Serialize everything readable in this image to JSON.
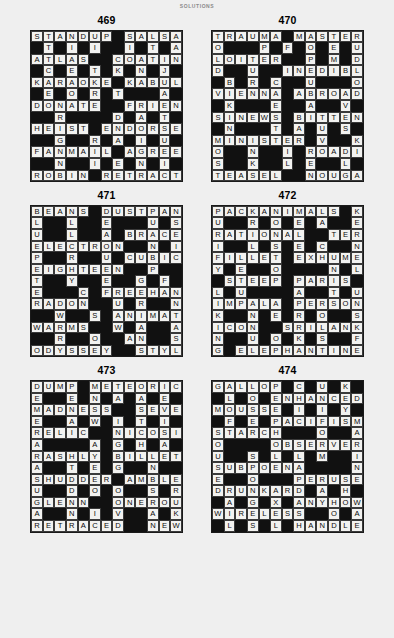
{
  "header": {
    "title": "SOLUTIONS"
  },
  "puzzles": [
    {
      "number": "469",
      "rows": [
        "STANDUP#SALSA",
        "#I##I##I#T##A",
        "ATLAS#COATING",
        "#E##T#K#N##J#",
        "KARAOKE#KABUL",
        "#O##R#T###A##",
        "DONATE#FRIEND",
        "#R####D#A#T#E",
        "HEIST#ENDORSE",
        "#G###R#A#I#U#",
        "FANMAIL#AGREE",
        "#N###I#E#N#I#",
        "ROBIN#RETRACT"
      ]
    },
    {
      "number": "470",
      "rows": [
        "TRAUMA#MASTER",
        "O###P#F#O#E##",
        "LOITER##P#M#U",
        "D###U#INEDIBL",
        "#B##R#C##U##O",
        "VIENNA#ABROAD",
        "#K###E###A##V",
        "SINEWS#BITTEN",
        "#N###T#A#U#S#",
        "MINISTER#V##K",
        "O###N#I#ROADIE",
        "S###K#L#E#L##",
        "TEASEL##NOUGAT"
      ]
    },
    {
      "number": "471",
      "rows": [
        "BEANS#DUSTPAN",
        "L##L##E###U#S",
        "U##L##A#BRACE",
        "ELECTRON##N#I",
        "P##R##U##CUBIC",
        "EIGHTEEN##P##O",
        "T##Y##E###G#F#L",
        "E###C#FREEHAND",
        "RADON##U#R##N#F",
        "#W##S#ANIMATOR",
        "WARMS#W#A##A#A",
        "#R##O##A#N##S#M",
        "ODYSSEY##STYLE"
      ]
    },
    {
      "number": "472",
      "rows": [
        "PACKANIMALS#K",
        "U##R#O#E#A##E",
        "RATIONAL##TERN",
        "I##L#S#E#C##N",
        "FILLET#EXHUME",
        "Y##E##O####N#L",
        "#STEEP#PARIS#",
        "L##U####A##T#U",
        "IMPALA#PERSON",
        "K##N##E#R#O##S",
        "ICON##SRILANKA",
        "N##U#O#K#S##F",
        "G#ELEPHANTINE"
      ]
    },
    {
      "number": "473",
      "rows": [
        "DUMP#METEORIC",
        "E##E#N#A#A#E#O",
        "MADNESS##SEVEN",
        "E##A#W#I#T#I#T",
        "RELIC##NICOSIA",
        "A####A#G#H#A#C",
        "RASHLY#BILLET",
        "A##T#E#G##N##L",
        "SHUDDER#AMBLE",
        "U##D#O#O##S#R#E",
        "GLENN##ONEROUS",
        "A##N#I#V##A#K#E",
        "RETRACED#NEWS"
      ]
    },
    {
      "number": "474",
      "rows": [
        "GALLOP#C#U#K#",
        "#L#O#ENHANCED",
        "MOUSSE#I##I#Y",
        "#F#E#PACIFISM",
        "STARCH###O##A",
        "O####OBSERVER",
        "U##S#L#L##M##I",
        "SUBPOENA####N",
        "E##O###PERUSE",
        "DRUNKARD#A#H#",
        "#A#G#X#ANYHOW",
        "WIRELESS##O#A",
        "#L#S#L#HANDLE"
      ]
    }
  ],
  "grids": {
    "p469": [
      [
        "S",
        "T",
        "A",
        "N",
        "D",
        "U",
        "P",
        "#",
        "S",
        "A",
        "L",
        "S",
        "A"
      ],
      [
        "#",
        "T",
        "#",
        "I",
        "#",
        "I",
        "#",
        "#",
        "I",
        "#",
        "T",
        "#",
        "A"
      ],
      [
        "A",
        "T",
        "L",
        "A",
        "S",
        "#",
        "#",
        "C",
        "O",
        "A",
        "T",
        "I",
        "N"
      ],
      [
        "#",
        "C",
        "#",
        "E",
        "#",
        "T",
        "#",
        "K",
        "#",
        "N",
        "#",
        "J",
        "#"
      ],
      [
        "K",
        "A",
        "R",
        "A",
        "O",
        "K",
        "E",
        "#",
        "K",
        "A",
        "B",
        "U",
        "L"
      ],
      [
        "#",
        "E",
        "#",
        "O",
        "#",
        "R",
        "#",
        "T",
        "#",
        "#",
        "#",
        "A",
        "#"
      ],
      [
        "D",
        "O",
        "N",
        "A",
        "T",
        "E",
        "#",
        "#",
        "F",
        "R",
        "I",
        "E",
        "N"
      ],
      [
        "#",
        "#",
        "R",
        "#",
        "#",
        "#",
        "#",
        "D",
        "#",
        "A",
        "#",
        "T",
        "#"
      ],
      [
        "H",
        "E",
        "I",
        "S",
        "T",
        "#",
        "E",
        "N",
        "D",
        "O",
        "R",
        "S",
        "E"
      ],
      [
        "#",
        "#",
        "G",
        "#",
        "#",
        "R",
        "#",
        "A",
        "#",
        "I",
        "#",
        "U",
        "#"
      ],
      [
        "F",
        "A",
        "N",
        "M",
        "A",
        "I",
        "L",
        "#",
        "A",
        "G",
        "R",
        "E",
        "E"
      ],
      [
        "#",
        "#",
        "N",
        "#",
        "#",
        "I",
        "#",
        "E",
        "#",
        "N",
        "#",
        "I",
        "#"
      ],
      [
        "R",
        "O",
        "B",
        "I",
        "N",
        "#",
        "R",
        "E",
        "T",
        "R",
        "A",
        "C",
        "T"
      ]
    ],
    "p470": [
      [
        "T",
        "R",
        "A",
        "U",
        "M",
        "A",
        "#",
        "M",
        "A",
        "S",
        "T",
        "E",
        "R"
      ],
      [
        "O",
        "#",
        "#",
        "#",
        "P",
        "#",
        "F",
        "#",
        "O",
        "#",
        "E",
        "#",
        "U"
      ],
      [
        "L",
        "O",
        "I",
        "T",
        "E",
        "R",
        "#",
        "#",
        "P",
        "#",
        "M",
        "#",
        "D"
      ],
      [
        "D",
        "#",
        "#",
        "U",
        "#",
        "#",
        "I",
        "N",
        "E",
        "D",
        "I",
        "B",
        "L"
      ],
      [
        "#",
        "B",
        "#",
        "R",
        "#",
        "C",
        "#",
        "#",
        "U",
        "#",
        "#",
        "#",
        "O"
      ],
      [
        "V",
        "I",
        "E",
        "N",
        "N",
        "A",
        "#",
        "A",
        "B",
        "R",
        "O",
        "A",
        "D"
      ],
      [
        "#",
        "K",
        "#",
        "#",
        "#",
        "E",
        "#",
        "#",
        "A",
        "#",
        "#",
        "V",
        "#"
      ],
      [
        "S",
        "I",
        "N",
        "E",
        "W",
        "S",
        "#",
        "B",
        "I",
        "T",
        "T",
        "E",
        "N"
      ],
      [
        "#",
        "N",
        "#",
        "#",
        "#",
        "T",
        "#",
        "A",
        "#",
        "U",
        "#",
        "S",
        "#"
      ],
      [
        "M",
        "I",
        "N",
        "I",
        "S",
        "T",
        "E",
        "R",
        "#",
        "V",
        "#",
        "#",
        "K"
      ],
      [
        "O",
        "#",
        "#",
        "N",
        "#",
        "#",
        "I",
        "#",
        "R",
        "O",
        "A",
        "D",
        "I"
      ],
      [
        "S",
        "#",
        "#",
        "K",
        "#",
        "#",
        "L",
        "#",
        "E",
        "#",
        "#",
        "L",
        "#"
      ],
      [
        "T",
        "E",
        "A",
        "S",
        "E",
        "L",
        "#",
        "#",
        "N",
        "O",
        "U",
        "G",
        "A"
      ]
    ],
    "p471": [
      [
        "B",
        "E",
        "A",
        "N",
        "S",
        "#",
        "D",
        "U",
        "S",
        "T",
        "P",
        "A",
        "N"
      ],
      [
        "L",
        "#",
        "#",
        "L",
        "#",
        "#",
        "E",
        "#",
        "#",
        "#",
        "U",
        "#",
        "S"
      ],
      [
        "U",
        "#",
        "#",
        "L",
        "#",
        "#",
        "A",
        "#",
        "B",
        "R",
        "A",
        "C",
        "E"
      ],
      [
        "E",
        "L",
        "E",
        "C",
        "T",
        "R",
        "O",
        "N",
        "#",
        "#",
        "N",
        "#",
        "I"
      ],
      [
        "P",
        "#",
        "#",
        "R",
        "#",
        "#",
        "U",
        "#",
        "C",
        "U",
        "B",
        "I",
        "C"
      ],
      [
        "E",
        "I",
        "G",
        "H",
        "T",
        "E",
        "E",
        "N",
        "#",
        "#",
        "P",
        "#",
        "#"
      ],
      [
        "T",
        "#",
        "#",
        "Y",
        "#",
        "#",
        "E",
        "#",
        "#",
        "G",
        "#",
        "F",
        "#"
      ],
      [
        "E",
        "#",
        "#",
        "#",
        "C",
        "#",
        "F",
        "R",
        "E",
        "E",
        "H",
        "A",
        "N"
      ],
      [
        "R",
        "A",
        "D",
        "O",
        "N",
        "#",
        "#",
        "U",
        "#",
        "R",
        "#",
        "#",
        "N"
      ],
      [
        "#",
        "#",
        "W",
        "#",
        "#",
        "S",
        "#",
        "A",
        "N",
        "I",
        "M",
        "A",
        "T"
      ],
      [
        "W",
        "A",
        "R",
        "M",
        "S",
        "#",
        "#",
        "W",
        "#",
        "A",
        "#",
        "#",
        "A"
      ],
      [
        "#",
        "#",
        "R",
        "#",
        "#",
        "O",
        "#",
        "#",
        "A",
        "N",
        "#",
        "#",
        "S"
      ],
      [
        "O",
        "D",
        "Y",
        "S",
        "S",
        "E",
        "Y",
        "#",
        "#",
        "S",
        "T",
        "Y",
        "L"
      ]
    ],
    "p472": [
      [
        "P",
        "A",
        "C",
        "K",
        "A",
        "N",
        "I",
        "M",
        "A",
        "L",
        "S",
        "#",
        "K"
      ],
      [
        "U",
        "#",
        "#",
        "R",
        "#",
        "O",
        "#",
        "E",
        "#",
        "A",
        "#",
        "#",
        "E"
      ],
      [
        "R",
        "A",
        "T",
        "I",
        "O",
        "N",
        "A",
        "L",
        "#",
        "#",
        "T",
        "E",
        "R"
      ],
      [
        "I",
        "#",
        "#",
        "L",
        "#",
        "S",
        "#",
        "E",
        "#",
        "C",
        "#",
        "#",
        "N"
      ],
      [
        "F",
        "I",
        "L",
        "L",
        "E",
        "T",
        "#",
        "E",
        "X",
        "H",
        "U",
        "M",
        "E"
      ],
      [
        "Y",
        "#",
        "E",
        "#",
        "#",
        "O",
        "#",
        "#",
        "#",
        "#",
        "N",
        "#",
        "L"
      ],
      [
        "#",
        "S",
        "T",
        "E",
        "E",
        "P",
        "#",
        "P",
        "A",
        "R",
        "I",
        "S",
        "#"
      ],
      [
        "L",
        "#",
        "U",
        "#",
        "#",
        "#",
        "#",
        "A",
        "#",
        "#",
        "T",
        "#",
        "U"
      ],
      [
        "I",
        "M",
        "P",
        "A",
        "L",
        "A",
        "#",
        "P",
        "E",
        "R",
        "S",
        "O",
        "N"
      ],
      [
        "K",
        "#",
        "#",
        "N",
        "#",
        "E",
        "#",
        "R",
        "#",
        "O",
        "#",
        "#",
        "S"
      ],
      [
        "I",
        "C",
        "O",
        "N",
        "#",
        "#",
        "S",
        "R",
        "I",
        "L",
        "A",
        "N",
        "K"
      ],
      [
        "N",
        "#",
        "#",
        "U",
        "#",
        "O",
        "#",
        "K",
        "#",
        "S",
        "#",
        "#",
        "F"
      ],
      [
        "G",
        "#",
        "E",
        "L",
        "E",
        "P",
        "H",
        "A",
        "N",
        "T",
        "I",
        "N",
        "E"
      ]
    ],
    "p473": [
      [
        "D",
        "U",
        "M",
        "P",
        "#",
        "M",
        "E",
        "T",
        "E",
        "O",
        "R",
        "I",
        "C"
      ],
      [
        "E",
        "#",
        "#",
        "E",
        "#",
        "N",
        "#",
        "A",
        "#",
        "A",
        "#",
        "E",
        "#"
      ],
      [
        "M",
        "A",
        "D",
        "N",
        "E",
        "S",
        "S",
        "#",
        "#",
        "S",
        "E",
        "V",
        "E"
      ],
      [
        "E",
        "#",
        "#",
        "A",
        "#",
        "W",
        "#",
        "I",
        "#",
        "T",
        "#",
        "I",
        "#"
      ],
      [
        "R",
        "E",
        "L",
        "I",
        "C",
        "#",
        "#",
        "N",
        "I",
        "C",
        "O",
        "S",
        "I"
      ],
      [
        "A",
        "#",
        "#",
        "#",
        "#",
        "A",
        "#",
        "G",
        "#",
        "H",
        "#",
        "A",
        "#"
      ],
      [
        "R",
        "A",
        "S",
        "H",
        "L",
        "Y",
        "#",
        "B",
        "I",
        "L",
        "L",
        "E",
        "T"
      ],
      [
        "A",
        "#",
        "#",
        "T",
        "#",
        "E",
        "#",
        "G",
        "#",
        "#",
        "N",
        "#",
        "#"
      ],
      [
        "S",
        "H",
        "U",
        "D",
        "D",
        "E",
        "R",
        "#",
        "A",
        "M",
        "B",
        "L",
        "E"
      ],
      [
        "U",
        "#",
        "#",
        "D",
        "#",
        "O",
        "#",
        "O",
        "#",
        "#",
        "S",
        "#",
        "R"
      ],
      [
        "G",
        "L",
        "E",
        "N",
        "N",
        "#",
        "#",
        "O",
        "N",
        "E",
        "R",
        "O",
        "U"
      ],
      [
        "A",
        "#",
        "#",
        "N",
        "#",
        "I",
        "#",
        "V",
        "#",
        "#",
        "A",
        "#",
        "K"
      ],
      [
        "R",
        "E",
        "T",
        "R",
        "A",
        "C",
        "E",
        "D",
        "#",
        "#",
        "N",
        "E",
        "W"
      ]
    ],
    "p474": [
      [
        "G",
        "A",
        "L",
        "L",
        "O",
        "P",
        "#",
        "C",
        "#",
        "U",
        "#",
        "K",
        "#"
      ],
      [
        "#",
        "L",
        "#",
        "O",
        "#",
        "E",
        "N",
        "H",
        "A",
        "N",
        "C",
        "E",
        "D"
      ],
      [
        "M",
        "O",
        "U",
        "S",
        "S",
        "E",
        "#",
        "I",
        "#",
        "I",
        "#",
        "Y",
        "#"
      ],
      [
        "#",
        "F",
        "#",
        "E",
        "#",
        "P",
        "A",
        "C",
        "I",
        "F",
        "I",
        "S",
        "M"
      ],
      [
        "S",
        "T",
        "A",
        "R",
        "C",
        "H",
        "#",
        "#",
        "#",
        "O",
        "#",
        "#",
        "A"
      ],
      [
        "O",
        "#",
        "#",
        "#",
        "#",
        "O",
        "B",
        "S",
        "E",
        "R",
        "V",
        "E",
        "R"
      ],
      [
        "U",
        "#",
        "#",
        "S",
        "#",
        "L",
        "#",
        "L",
        "#",
        "M",
        "#",
        "#",
        "I"
      ],
      [
        "S",
        "U",
        "B",
        "P",
        "O",
        "E",
        "N",
        "A",
        "#",
        "#",
        "#",
        "#",
        "N"
      ],
      [
        "E",
        "#",
        "#",
        "O",
        "#",
        "#",
        "#",
        "P",
        "E",
        "R",
        "U",
        "S",
        "E"
      ],
      [
        "D",
        "R",
        "U",
        "N",
        "K",
        "A",
        "R",
        "D",
        "#",
        "A",
        "#",
        "H",
        "#"
      ],
      [
        "#",
        "A",
        "#",
        "G",
        "#",
        "X",
        "#",
        "A",
        "N",
        "Y",
        "H",
        "O",
        "W"
      ],
      [
        "W",
        "I",
        "R",
        "E",
        "L",
        "E",
        "S",
        "S",
        "#",
        "#",
        "O",
        "#",
        "A"
      ],
      [
        "#",
        "L",
        "#",
        "S",
        "#",
        "L",
        "#",
        "H",
        "A",
        "N",
        "D",
        "L",
        "E"
      ]
    ]
  }
}
